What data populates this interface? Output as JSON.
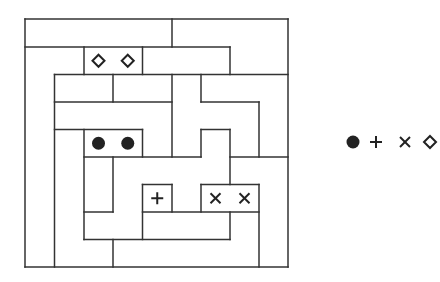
{
  "puzzle": {
    "grid": {
      "cols": 9,
      "rows": 9,
      "x_lines": [
        25,
        54.5,
        84,
        113,
        142.5,
        172,
        201,
        230,
        259,
        288
      ],
      "y_lines": [
        19,
        47,
        74.5,
        102,
        129.5,
        157,
        184.5,
        212,
        239.5,
        267
      ]
    },
    "line_color": "#333333",
    "symbol_color": "#222222",
    "horizontal_segments": [
      {
        "row": 0,
        "from": 0,
        "to": 9
      },
      {
        "row": 1,
        "from": 0,
        "to": 7
      },
      {
        "row": 2,
        "from": 1,
        "to": 9
      },
      {
        "row": 3,
        "from": 1,
        "to": 5
      },
      {
        "row": 3,
        "from": 6,
        "to": 8
      },
      {
        "row": 4,
        "from": 1,
        "to": 4
      },
      {
        "row": 4,
        "from": 6,
        "to": 7
      },
      {
        "row": 5,
        "from": 2,
        "to": 6
      },
      {
        "row": 5,
        "from": 7,
        "to": 9
      },
      {
        "row": 6,
        "from": 4,
        "to": 5
      },
      {
        "row": 6,
        "from": 6,
        "to": 8
      },
      {
        "row": 7,
        "from": 2,
        "to": 3
      },
      {
        "row": 7,
        "from": 4,
        "to": 8
      },
      {
        "row": 8,
        "from": 2,
        "to": 7
      },
      {
        "row": 9,
        "from": 0,
        "to": 9
      }
    ],
    "vertical_segments": [
      {
        "col": 0,
        "from": 0,
        "to": 9
      },
      {
        "col": 9,
        "from": 0,
        "to": 9
      },
      {
        "col": 5,
        "from": 0,
        "to": 1
      },
      {
        "col": 2,
        "from": 1,
        "to": 2
      },
      {
        "col": 4,
        "from": 1,
        "to": 2
      },
      {
        "col": 7,
        "from": 1,
        "to": 2
      },
      {
        "col": 1,
        "from": 2,
        "to": 9
      },
      {
        "col": 3,
        "from": 2,
        "to": 3
      },
      {
        "col": 5,
        "from": 2,
        "to": 5
      },
      {
        "col": 6,
        "from": 2,
        "to": 3
      },
      {
        "col": 8,
        "from": 3,
        "to": 5
      },
      {
        "col": 2,
        "from": 4,
        "to": 8
      },
      {
        "col": 4,
        "from": 4,
        "to": 5
      },
      {
        "col": 6,
        "from": 4,
        "to": 5
      },
      {
        "col": 7,
        "from": 4,
        "to": 6
      },
      {
        "col": 3,
        "from": 5,
        "to": 7
      },
      {
        "col": 4,
        "from": 6,
        "to": 8
      },
      {
        "col": 5,
        "from": 6,
        "to": 7
      },
      {
        "col": 6,
        "from": 6,
        "to": 7
      },
      {
        "col": 8,
        "from": 6,
        "to": 9
      },
      {
        "col": 7,
        "from": 7,
        "to": 8
      },
      {
        "col": 3,
        "from": 8,
        "to": 9
      }
    ],
    "symbols": [
      {
        "type": "diamond",
        "col": 2,
        "row": 1,
        "name": "diamond-symbol"
      },
      {
        "type": "diamond",
        "col": 3,
        "row": 1,
        "name": "diamond-symbol"
      },
      {
        "type": "dot",
        "col": 2,
        "row": 4,
        "name": "dot-symbol"
      },
      {
        "type": "dot",
        "col": 3,
        "row": 4,
        "name": "dot-symbol"
      },
      {
        "type": "plus",
        "col": 4,
        "row": 6,
        "name": "plus-symbol"
      },
      {
        "type": "cross",
        "col": 6,
        "row": 6,
        "name": "cross-symbol"
      },
      {
        "type": "cross",
        "col": 7,
        "row": 6,
        "name": "cross-symbol"
      }
    ]
  },
  "legend": {
    "items": [
      {
        "type": "dot",
        "glyph": "●",
        "x": 353,
        "y": 142
      },
      {
        "type": "plus",
        "glyph": "+",
        "x": 376,
        "y": 142
      },
      {
        "type": "cross",
        "glyph": "×",
        "x": 405,
        "y": 142
      },
      {
        "type": "diamond",
        "glyph": "◇",
        "x": 430,
        "y": 142
      }
    ]
  }
}
